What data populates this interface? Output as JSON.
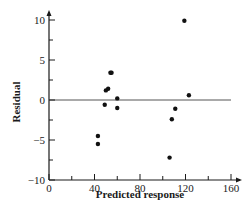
{
  "chart_data": {
    "type": "scatter",
    "title": "",
    "xlabel": "Predicted response",
    "ylabel": "Residual",
    "xlim": [
      0,
      160
    ],
    "ylim": [
      -10,
      10
    ],
    "x_ticks": [
      0,
      40,
      80,
      120,
      160
    ],
    "x_minor_ticks": [
      20,
      60,
      100,
      140
    ],
    "y_ticks": [
      -10,
      -5,
      0,
      5,
      10
    ],
    "y_minor_ticks": [
      -7.5,
      -2.5,
      2.5,
      7.5
    ],
    "reference_line": {
      "y": 0,
      "x_from": 0,
      "x_to": 160
    },
    "grid": false,
    "legend": null,
    "points": [
      {
        "x": 43,
        "y": -4.5
      },
      {
        "x": 43,
        "y": -5.5
      },
      {
        "x": 49,
        "y": -0.6
      },
      {
        "x": 50,
        "y": 1.2
      },
      {
        "x": 52,
        "y": 1.4
      },
      {
        "x": 54,
        "y": 3.4
      },
      {
        "x": 55,
        "y": 3.4
      },
      {
        "x": 60,
        "y": 0.2
      },
      {
        "x": 60,
        "y": -1.0
      },
      {
        "x": 106,
        "y": -7.2
      },
      {
        "x": 108,
        "y": -2.4
      },
      {
        "x": 111,
        "y": -1.1
      },
      {
        "x": 119,
        "y": 9.9
      },
      {
        "x": 123,
        "y": 0.6
      }
    ]
  },
  "colors": {
    "axis": "#1a1a1a",
    "reference_line": "#555555",
    "point": "#111111"
  }
}
